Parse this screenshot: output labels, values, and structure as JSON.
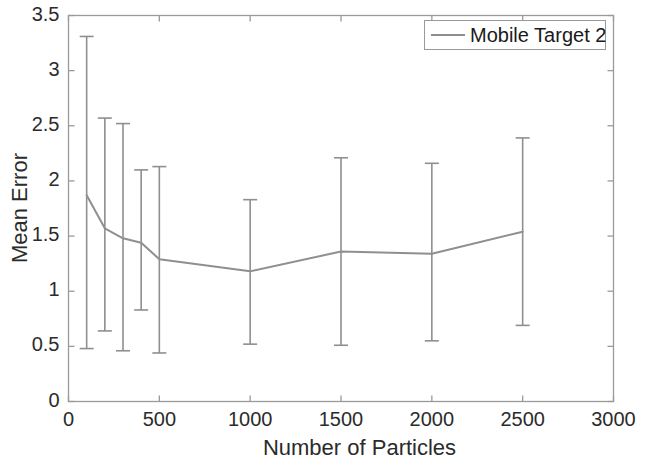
{
  "chart_data": {
    "type": "line",
    "title": "",
    "subtitle": "",
    "xlabel": "Number of Particles",
    "ylabel": "Mean Error",
    "xlim": [
      0,
      3000
    ],
    "ylim": [
      0,
      3.5
    ],
    "xticks": [
      0,
      500,
      1000,
      1500,
      2000,
      2500,
      3000
    ],
    "xtick_labels": [
      "0",
      "500",
      "1000",
      "1500",
      "2000",
      "2500",
      "3000"
    ],
    "yticks": [
      0,
      0.5,
      1,
      1.5,
      2,
      2.5,
      3,
      3.5
    ],
    "ytick_labels": [
      "0",
      "0.5",
      "1",
      "1.5",
      "2",
      "2.5",
      "3",
      "3.5"
    ],
    "grid": false,
    "legend_position": "top-right",
    "legend": [
      "Mobile Target 2"
    ],
    "series_color": "#8f8f8f",
    "axis_color": "#9a9a9a",
    "text_color": "#2b2b2b",
    "has_error_bars": true,
    "error_bar_style": "asymmetric-capped",
    "series": [
      {
        "name": "Mobile Target 2",
        "color": "#8f8f8f",
        "x": [
          100,
          200,
          300,
          400,
          500,
          1000,
          1500,
          2000,
          2500
        ],
        "values": [
          1.87,
          1.57,
          1.48,
          1.44,
          1.29,
          1.18,
          1.36,
          1.34,
          1.54
        ],
        "error_upper": [
          3.31,
          2.57,
          2.52,
          2.1,
          2.13,
          1.83,
          2.21,
          2.16,
          2.39
        ],
        "error_lower": [
          0.48,
          0.64,
          0.46,
          0.83,
          0.44,
          0.52,
          0.51,
          0.55,
          0.69
        ]
      }
    ]
  },
  "axes": {
    "ylabel": "Mean Error",
    "xlabel": "Number of Particles"
  },
  "legend": {
    "entry_0": "Mobile Target 2"
  }
}
